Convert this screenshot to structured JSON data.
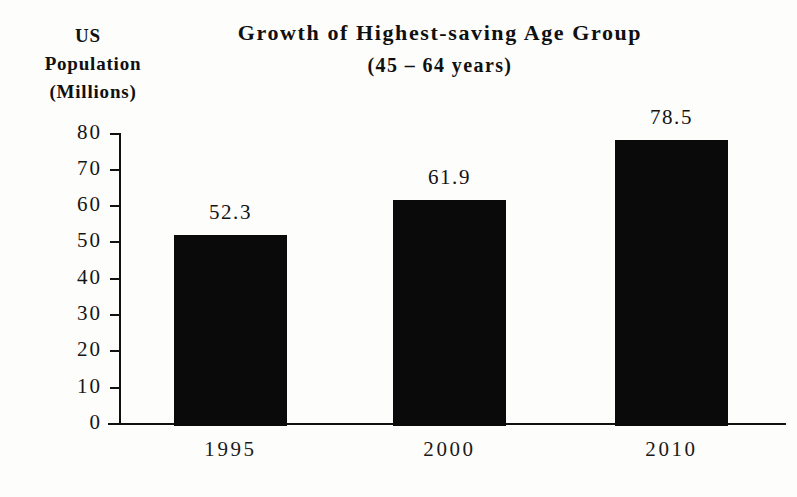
{
  "chart_data": {
    "type": "bar",
    "title": "Growth of Highest-saving Age Group",
    "subtitle": "(45 – 64 years)",
    "ylabel_lines": [
      "US",
      "Population",
      "(Millions)"
    ],
    "xlabel": "",
    "categories": [
      "1995",
      "2000",
      "2010"
    ],
    "values": [
      52.3,
      61.9,
      78.5
    ],
    "value_labels": [
      "52.3",
      "61.9",
      "78.5"
    ],
    "ylim": [
      0,
      80
    ],
    "ytick_values": [
      80,
      70,
      60,
      50,
      40,
      30,
      20,
      10,
      0
    ],
    "ytick_labels": [
      "80",
      "70",
      "60",
      "50",
      "40",
      "30",
      "20",
      "10",
      "0"
    ],
    "grid": false,
    "legend": null,
    "bar_color": "#0a0a0a",
    "background_color": "#fdfdfc",
    "axis_color": "#111111"
  }
}
